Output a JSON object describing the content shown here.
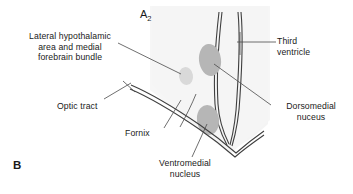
{
  "figure": {
    "panel_a_label": "A",
    "panel_a_subscript": "2",
    "panel_b_label": "B"
  },
  "labels": {
    "lateral_hypothalamic": {
      "line1": "Lateral hypothalamic",
      "line2": "area and medial",
      "line3": "forebrain bundle"
    },
    "optic_tract": {
      "line1": "Optic tract"
    },
    "fornix": {
      "line1": "Fornix"
    },
    "ventromedial": {
      "line1": "Ventromedial",
      "line2": "nucleus"
    },
    "third_ventricle": {
      "line1": "Third",
      "line2": "ventricle"
    },
    "dorsomedial": {
      "line1": "Dorsomedial",
      "line2": "nuceus"
    }
  },
  "colors": {
    "background": "#ffffff",
    "tissue_fill": "#f3f3f3",
    "nucleus_dark": "#b4b4b4",
    "nucleus_light": "#d8d8d8",
    "outline": "#3c3c3c",
    "text": "#1a1a1a",
    "leader_line": "#4a4a4a"
  }
}
